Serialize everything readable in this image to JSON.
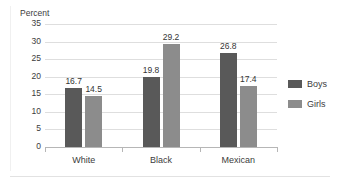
{
  "chart_data": {
    "type": "bar",
    "title": "",
    "subtitle": "",
    "xlabel": "",
    "ylabel": "Percent",
    "ylim": [
      0,
      35
    ],
    "yticks": [
      0,
      5,
      10,
      15,
      20,
      25,
      30,
      35
    ],
    "ytick_labels": [
      "0",
      "5",
      "10",
      "15",
      "20",
      "25",
      "30",
      "35"
    ],
    "grid": true,
    "legend_position": "right",
    "categories": [
      "White",
      "Black",
      "Mexican"
    ],
    "series": [
      {
        "name": "Boys",
        "color": "#595959",
        "values": [
          16.7,
          19.8,
          26.8
        ],
        "labels": [
          "16.7",
          "19.8",
          "26.8"
        ]
      },
      {
        "name": "Girls",
        "color": "#8c8c8c",
        "values": [
          14.5,
          29.2,
          17.4
        ],
        "labels": [
          "14.5",
          "29.2",
          "17.4"
        ]
      }
    ],
    "legend": [
      "Boys",
      "Girls"
    ],
    "annotations": []
  },
  "colors": {
    "boys": "#595959",
    "girls": "#8c8c8c",
    "gridline": "#dedede",
    "axis": "#b6b6b6",
    "text": "#3c3c3c",
    "background": "#ffffff"
  }
}
